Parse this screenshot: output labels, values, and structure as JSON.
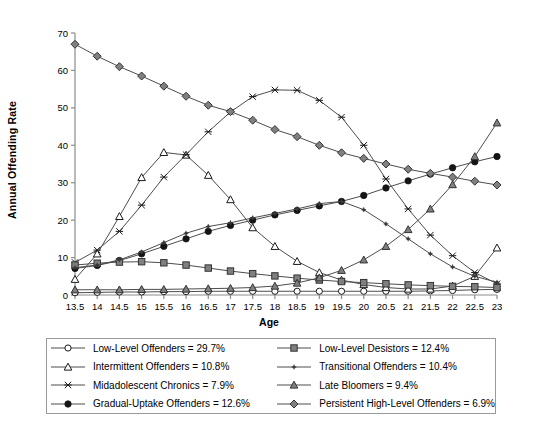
{
  "chart_data": {
    "type": "line",
    "title": "",
    "xlabel": "Age",
    "ylabel": "Annual Offending Rate",
    "xlim": [
      13.5,
      23
    ],
    "ylim": [
      0,
      70
    ],
    "yticks": [
      0,
      10,
      20,
      30,
      40,
      50,
      60,
      70
    ],
    "grid": false,
    "legend_position": "bottom",
    "x": [
      13.5,
      14,
      14.5,
      15,
      15.5,
      16,
      16.5,
      17,
      17.5,
      18,
      18.5,
      19,
      19.5,
      20,
      20.5,
      21,
      21.5,
      22,
      22.5,
      23
    ],
    "xtick_labels": [
      "13.5",
      "14",
      "14.5",
      "15",
      "15.5",
      "16",
      "16.5",
      "17",
      "17.5",
      "18",
      "18.5",
      "19",
      "19.5",
      "20",
      "20.5",
      "21",
      "21.5",
      "22",
      "22.5",
      "23"
    ],
    "series": [
      {
        "name": "Low-Level Offenders",
        "percent": "29.7%",
        "marker": "open-circle",
        "values": [
          0.6,
          0.7,
          0.8,
          0.8,
          0.9,
          0.9,
          1.0,
          1.0,
          1.0,
          1.0,
          1.0,
          1.0,
          1.0,
          1.0,
          1.0,
          1.0,
          1.1,
          1.2,
          1.4,
          1.5
        ]
      },
      {
        "name": "Intermittent Offenders",
        "percent": "10.8%",
        "marker": "open-triangle",
        "values": [
          4.2,
          11.0,
          21.0,
          31.4,
          38.1,
          37.4,
          32.0,
          25.5,
          18.0,
          13.0,
          9.0,
          6.0,
          4.0,
          2.8,
          2.0,
          1.6,
          1.6,
          2.4,
          5.0,
          12.6
        ]
      },
      {
        "name": "Midadolescent Chronics",
        "percent": "7.9%",
        "marker": "x-cross",
        "values": [
          8.7,
          12.0,
          17.0,
          24.0,
          31.5,
          37.5,
          43.6,
          48.9,
          53.0,
          54.8,
          54.7,
          52.0,
          47.5,
          40.0,
          31.0,
          23.0,
          16.0,
          10.5,
          6.0,
          3.0
        ]
      },
      {
        "name": "Gradual-Uptake Offenders",
        "percent": "12.6%",
        "marker": "filled-circle",
        "values": [
          7.1,
          7.9,
          9.2,
          11.0,
          13.0,
          15.0,
          17.0,
          18.6,
          20.0,
          21.4,
          22.6,
          23.8,
          25.0,
          26.6,
          28.6,
          30.5,
          32.3,
          34.0,
          35.6,
          37.0
        ]
      },
      {
        "name": "Low-Level Desistors",
        "percent": "12.4%",
        "marker": "gray-square",
        "values": [
          8.0,
          8.5,
          8.8,
          8.9,
          8.6,
          8.0,
          7.2,
          6.4,
          5.7,
          5.1,
          4.5,
          4.0,
          3.6,
          3.3,
          3.0,
          2.7,
          2.5,
          2.3,
          2.2,
          2.0
        ]
      },
      {
        "name": "Transitional Offenders",
        "percent": "10.4%",
        "marker": "small-asterisk",
        "values": [
          7.3,
          8.0,
          9.4,
          11.5,
          14.0,
          16.5,
          18.3,
          19.3,
          20.6,
          21.8,
          23.0,
          24.4,
          25.0,
          22.8,
          19.0,
          15.0,
          11.0,
          7.5,
          5.0,
          3.4
        ]
      },
      {
        "name": "Late Bloomers",
        "percent": "9.4%",
        "marker": "gray-triangle",
        "values": [
          1.4,
          1.4,
          1.4,
          1.5,
          1.5,
          1.6,
          1.7,
          1.8,
          2.0,
          2.4,
          3.2,
          4.6,
          6.6,
          9.4,
          13.0,
          17.5,
          23.0,
          29.5,
          37.0,
          46.0
        ]
      },
      {
        "name": "Persistent High-Level Offenders",
        "percent": "6.9%",
        "marker": "gray-diamond",
        "values": [
          67.0,
          63.8,
          61.0,
          58.5,
          55.8,
          53.1,
          50.7,
          49.0,
          46.7,
          44.2,
          42.3,
          40.0,
          38.0,
          36.5,
          35.0,
          33.6,
          32.5,
          31.5,
          30.4,
          29.4
        ]
      }
    ]
  },
  "axis": {
    "ylabel": "Annual Offending Rate",
    "xlabel": "Age"
  },
  "legend": {
    "rows": [
      {
        "left": "Low-Level Offenders = 29.7%",
        "right": "Low-Level Desistors = 12.4%"
      },
      {
        "left": "Intermittent Offenders = 10.8%",
        "right": "Transitional Offenders = 10.4%"
      },
      {
        "left": "Midadolescent Chronics = 7.9%",
        "right": "Late Bloomers = 9.4%"
      },
      {
        "left": "Gradual-Uptake Offenders = 12.6%",
        "right": "Persistent High-Level Offenders = 6.9%"
      }
    ]
  },
  "colors": {
    "line": "#4d4d4d",
    "dark": "#1a1a1a",
    "gray_fill": "#808080",
    "axis": "#8c8c8c",
    "legend_border": "#9a9a9a"
  }
}
